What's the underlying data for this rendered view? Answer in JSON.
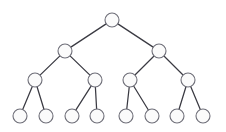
{
  "figure": {
    "kind": "node-link-tree",
    "background_color": "#ffffff",
    "node_fill_color": "#fbfbfb",
    "node_stroke_color": "#6e6e78",
    "edge_color": "#3a3a42",
    "node_radius": 7,
    "node_count": 15,
    "edge_count": 14,
    "depth_levels": 4
  },
  "nodes": [
    {
      "id": "root",
      "label": "",
      "level": 0,
      "x": 112,
      "y": 20
    },
    {
      "id": "n-l",
      "label": "",
      "level": 1,
      "x": 65,
      "y": 51
    },
    {
      "id": "n-r",
      "label": "",
      "level": 1,
      "x": 159,
      "y": 51
    },
    {
      "id": "n-ll",
      "label": "",
      "level": 2,
      "x": 35,
      "y": 80
    },
    {
      "id": "n-lr",
      "label": "",
      "level": 2,
      "x": 95,
      "y": 80
    },
    {
      "id": "n-rl",
      "label": "",
      "level": 2,
      "x": 130,
      "y": 80
    },
    {
      "id": "n-rr",
      "label": "",
      "level": 2,
      "x": 188,
      "y": 80
    },
    {
      "id": "leaf-1",
      "label": "",
      "level": 3,
      "x": 20,
      "y": 116
    },
    {
      "id": "leaf-2",
      "label": "",
      "level": 3,
      "x": 46,
      "y": 116
    },
    {
      "id": "leaf-3",
      "label": "",
      "level": 3,
      "x": 72,
      "y": 116
    },
    {
      "id": "leaf-4",
      "label": "",
      "level": 3,
      "x": 97,
      "y": 116
    },
    {
      "id": "leaf-5",
      "label": "",
      "level": 3,
      "x": 126,
      "y": 116
    },
    {
      "id": "leaf-6",
      "label": "",
      "level": 3,
      "x": 152,
      "y": 116
    },
    {
      "id": "leaf-7",
      "label": "",
      "level": 3,
      "x": 177,
      "y": 116
    },
    {
      "id": "leaf-8",
      "label": "",
      "level": 3,
      "x": 203,
      "y": 116
    }
  ],
  "edges": [
    {
      "from": "root",
      "to": "n-l",
      "x1": 112,
      "y1": 20,
      "x2": 65,
      "y2": 51
    },
    {
      "from": "root",
      "to": "n-r",
      "x1": 112,
      "y1": 20,
      "x2": 159,
      "y2": 51
    },
    {
      "from": "n-l",
      "to": "n-ll",
      "x1": 65,
      "y1": 51,
      "x2": 35,
      "y2": 80
    },
    {
      "from": "n-l",
      "to": "n-lr",
      "x1": 65,
      "y1": 51,
      "x2": 95,
      "y2": 80
    },
    {
      "from": "n-r",
      "to": "n-rl",
      "x1": 159,
      "y1": 51,
      "x2": 130,
      "y2": 80
    },
    {
      "from": "n-r",
      "to": "n-rr",
      "x1": 159,
      "y1": 51,
      "x2": 188,
      "y2": 80
    },
    {
      "from": "n-ll",
      "to": "leaf-1",
      "x1": 35,
      "y1": 80,
      "x2": 20,
      "y2": 116
    },
    {
      "from": "n-ll",
      "to": "leaf-2",
      "x1": 35,
      "y1": 80,
      "x2": 46,
      "y2": 116
    },
    {
      "from": "n-lr",
      "to": "leaf-3",
      "x1": 95,
      "y1": 80,
      "x2": 72,
      "y2": 116
    },
    {
      "from": "n-lr",
      "to": "leaf-4",
      "x1": 95,
      "y1": 80,
      "x2": 97,
      "y2": 116
    },
    {
      "from": "n-rl",
      "to": "leaf-5",
      "x1": 130,
      "y1": 80,
      "x2": 126,
      "y2": 116
    },
    {
      "from": "n-rl",
      "to": "leaf-6",
      "x1": 130,
      "y1": 80,
      "x2": 152,
      "y2": 116
    },
    {
      "from": "n-rr",
      "to": "leaf-7",
      "x1": 188,
      "y1": 80,
      "x2": 177,
      "y2": 116
    },
    {
      "from": "n-rr",
      "to": "leaf-8",
      "x1": 188,
      "y1": 80,
      "x2": 203,
      "y2": 116
    }
  ]
}
